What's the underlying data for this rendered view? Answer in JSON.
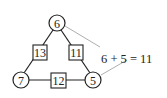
{
  "diagram": {
    "type": "magic-triangle",
    "nodes": [
      {
        "id": "top",
        "value": "6",
        "shape": "circle"
      },
      {
        "id": "bottom-left",
        "value": "7",
        "shape": "circle"
      },
      {
        "id": "bottom-right",
        "value": "5",
        "shape": "circle"
      }
    ],
    "edges": [
      {
        "id": "left",
        "from": "top",
        "to": "bottom-left",
        "sum": "13",
        "shape": "square"
      },
      {
        "id": "right",
        "from": "top",
        "to": "bottom-right",
        "sum": "11",
        "shape": "square"
      },
      {
        "id": "bottom",
        "from": "bottom-left",
        "to": "bottom-right",
        "sum": "12",
        "shape": "square"
      }
    ],
    "annotation": "6 + 5 = 11",
    "colors": {
      "stroke": "#222222",
      "pointer": "#999999",
      "background": "#ffffff"
    }
  }
}
